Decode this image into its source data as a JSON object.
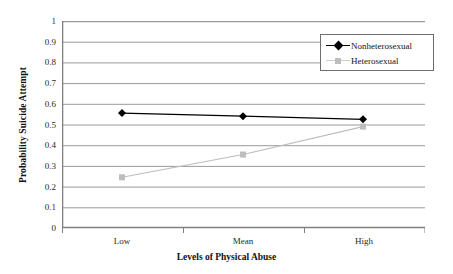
{
  "chart_data": {
    "type": "line",
    "title": "",
    "xlabel": "Levels of Physical Abuse",
    "ylabel": "Probability Suicide Attempt",
    "categories": [
      "Low",
      "Mean",
      "High"
    ],
    "series": [
      {
        "name": "Nonheterosexual",
        "values": [
          0.555,
          0.54,
          0.525
        ],
        "color": "#000000",
        "marker": "diamond"
      },
      {
        "name": "Heterosexual",
        "values": [
          0.245,
          0.355,
          0.49
        ],
        "color": "#bdbdbd",
        "marker": "square"
      }
    ],
    "ylim": [
      0,
      1
    ],
    "yticks": [
      "0",
      "0.1",
      "0.2",
      "0.3",
      "0.4",
      "0.5",
      "0.6",
      "0.7",
      "0.8",
      "0.9",
      "1"
    ],
    "ytick_values": [
      0,
      0.1,
      0.2,
      0.3,
      0.4,
      0.5,
      0.6,
      0.7,
      0.8,
      0.9,
      1
    ],
    "grid": "horizontal",
    "legend_position": "top-right",
    "axis_color": "#808080",
    "grid_color": "#9a9a9a"
  },
  "legend": {
    "items": [
      {
        "label": "Nonheterosexual",
        "marker": "diamond-marker-icon"
      },
      {
        "label": "Heterosexual",
        "marker": "square-marker-icon"
      }
    ]
  }
}
